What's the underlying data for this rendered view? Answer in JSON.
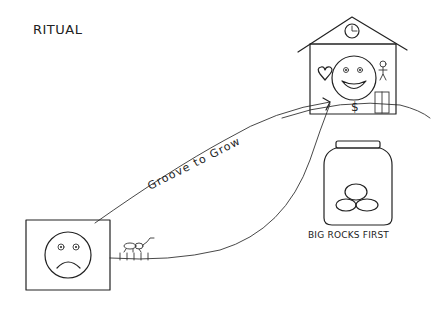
{
  "title": "RITUAL",
  "path_label": "Groove to Grow",
  "jar_caption": "BIG ROCKS FIRST",
  "start": {
    "icon": "sad-face",
    "frame": "square"
  },
  "destination": {
    "icon": "house",
    "contents": [
      "clock",
      "smiling-face",
      "heart",
      "stick-figure",
      "dollar-sign",
      "door"
    ]
  },
  "jar": {
    "icon": "jar",
    "contents": [
      "rock",
      "rock",
      "rock"
    ]
  },
  "path_ornament": "ant-on-ruler",
  "colors": {
    "ink": "#222222",
    "background": "#ffffff"
  }
}
